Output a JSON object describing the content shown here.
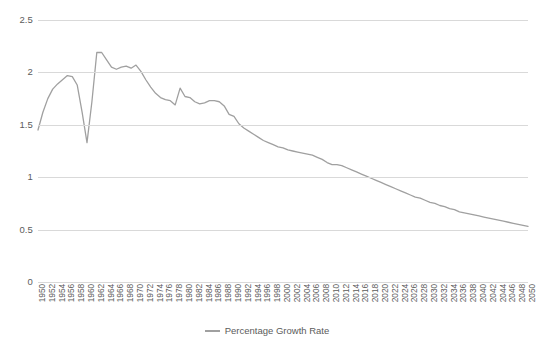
{
  "chart_data": {
    "type": "line",
    "title": "",
    "xlabel": "",
    "ylabel": "",
    "ylim": [
      0,
      2.5
    ],
    "ytick_values": [
      2.5,
      2,
      1.5,
      1,
      0.5,
      0
    ],
    "ytick_labels": [
      "2.5",
      "2",
      "1.5",
      "1",
      "0.5",
      "0"
    ],
    "grid": "horizontal",
    "legend_position": "bottom-center",
    "legend": [
      "Percentage Growth Rate"
    ],
    "line_color": "#a0a0a0",
    "gridline_color": "#d9d9d9",
    "text_color": "#5b5b5b",
    "x_tick_labels": [
      "1950",
      "1952",
      "1954",
      "1956",
      "1958",
      "1960",
      "1962",
      "1964",
      "1966",
      "1968",
      "1970",
      "1972",
      "1974",
      "1976",
      "1978",
      "1980",
      "1982",
      "1984",
      "1986",
      "1988",
      "1990",
      "1992",
      "1994",
      "1996",
      "1998",
      "2000",
      "2002",
      "2004",
      "2006",
      "2008",
      "2010",
      "2012",
      "2014",
      "2016",
      "2018",
      "2020",
      "2022",
      "2024",
      "2026",
      "2028",
      "2030",
      "2032",
      "2034",
      "2036",
      "2038",
      "2040",
      "2042",
      "2044",
      "2046",
      "2048",
      "2050"
    ],
    "x": [
      1950,
      1951,
      1952,
      1953,
      1954,
      1955,
      1956,
      1957,
      1958,
      1959,
      1960,
      1961,
      1962,
      1963,
      1964,
      1965,
      1966,
      1967,
      1968,
      1969,
      1970,
      1971,
      1972,
      1973,
      1974,
      1975,
      1976,
      1977,
      1978,
      1979,
      1980,
      1981,
      1982,
      1983,
      1984,
      1985,
      1986,
      1987,
      1988,
      1989,
      1990,
      1991,
      1992,
      1993,
      1994,
      1995,
      1996,
      1997,
      1998,
      1999,
      2000,
      2001,
      2002,
      2003,
      2004,
      2005,
      2006,
      2007,
      2008,
      2009,
      2010,
      2011,
      2012,
      2013,
      2014,
      2015,
      2016,
      2017,
      2018,
      2019,
      2020,
      2021,
      2022,
      2023,
      2024,
      2025,
      2026,
      2027,
      2028,
      2029,
      2030,
      2031,
      2032,
      2033,
      2034,
      2035,
      2036,
      2037,
      2038,
      2039,
      2040,
      2041,
      2042,
      2043,
      2044,
      2045,
      2046,
      2047,
      2048,
      2049,
      2050
    ],
    "series": [
      {
        "name": "Percentage Growth Rate",
        "values": [
          1.45,
          1.62,
          1.75,
          1.84,
          1.89,
          1.93,
          1.97,
          1.96,
          1.88,
          1.62,
          1.33,
          1.72,
          2.19,
          2.19,
          2.12,
          2.05,
          2.03,
          2.05,
          2.06,
          2.04,
          2.07,
          2.01,
          1.93,
          1.86,
          1.8,
          1.76,
          1.74,
          1.73,
          1.69,
          1.85,
          1.77,
          1.76,
          1.72,
          1.7,
          1.71,
          1.73,
          1.73,
          1.72,
          1.68,
          1.6,
          1.58,
          1.51,
          1.47,
          1.44,
          1.41,
          1.38,
          1.35,
          1.33,
          1.31,
          1.29,
          1.28,
          1.26,
          1.25,
          1.24,
          1.23,
          1.22,
          1.21,
          1.19,
          1.17,
          1.14,
          1.12,
          1.12,
          1.11,
          1.09,
          1.07,
          1.05,
          1.03,
          1.01,
          0.99,
          0.97,
          0.95,
          0.93,
          0.91,
          0.89,
          0.87,
          0.85,
          0.83,
          0.81,
          0.8,
          0.78,
          0.76,
          0.75,
          0.73,
          0.72,
          0.7,
          0.69,
          0.67,
          0.66,
          0.65,
          0.64,
          0.63,
          0.62,
          0.61,
          0.6,
          0.59,
          0.58,
          0.57,
          0.56,
          0.55,
          0.54,
          0.53
        ]
      }
    ]
  }
}
